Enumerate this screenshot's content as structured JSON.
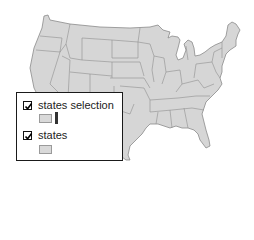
{
  "map": {
    "title": "Contiguous United States",
    "fill_color": "#d6d6d6",
    "border_color": "#8a8a8a",
    "background": "#ffffff"
  },
  "legend": {
    "layers": [
      {
        "name": "states selection",
        "checked": true,
        "symbols": [
          {
            "type": "polygon",
            "fill": "#d9d9d9"
          },
          {
            "type": "bar",
            "fill": "#333333"
          }
        ]
      },
      {
        "name": "states",
        "checked": true,
        "symbols": [
          {
            "type": "polygon",
            "fill": "#d9d9d9"
          }
        ]
      }
    ]
  }
}
